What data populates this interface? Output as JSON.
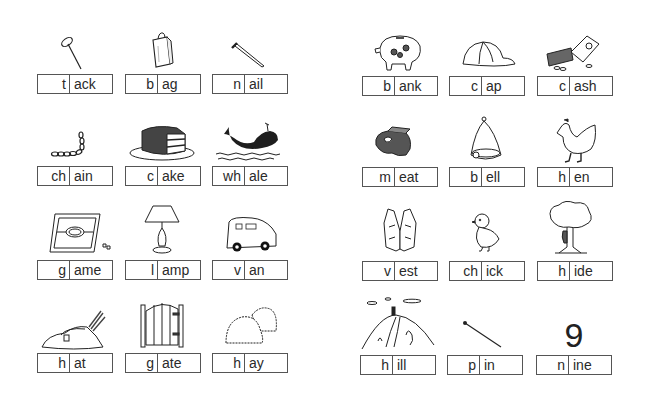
{
  "worksheet": {
    "left_page": {
      "rows": [
        [
          {
            "onset": "t",
            "rime": "ack",
            "picture": "tack-icon"
          },
          {
            "onset": "b",
            "rime": "ag",
            "picture": "bag-icon"
          },
          {
            "onset": "n",
            "rime": "ail",
            "picture": "nail-icon"
          }
        ],
        [
          {
            "onset": "ch",
            "rime": "ain",
            "picture": "chain-icon"
          },
          {
            "onset": "c",
            "rime": "ake",
            "picture": "cake-icon"
          },
          {
            "onset": "wh",
            "rime": "ale",
            "picture": "whale-icon"
          }
        ],
        [
          {
            "onset": "g",
            "rime": "ame",
            "picture": "board-game-icon"
          },
          {
            "onset": "l",
            "rime": "amp",
            "picture": "lamp-icon"
          },
          {
            "onset": "v",
            "rime": "an",
            "picture": "van-icon"
          }
        ],
        [
          {
            "onset": "h",
            "rime": "at",
            "picture": "hat-icon"
          },
          {
            "onset": "g",
            "rime": "ate",
            "picture": "gate-icon"
          },
          {
            "onset": "h",
            "rime": "ay",
            "picture": "hay-icon"
          }
        ]
      ]
    },
    "right_page": {
      "rows": [
        [
          {
            "onset": "b",
            "rime": "ank",
            "picture": "piggy-bank-icon"
          },
          {
            "onset": "c",
            "rime": "ap",
            "picture": "cap-icon"
          },
          {
            "onset": "c",
            "rime": "ash",
            "picture": "cash-icon"
          }
        ],
        [
          {
            "onset": "m",
            "rime": "eat",
            "picture": "meat-icon"
          },
          {
            "onset": "b",
            "rime": "ell",
            "picture": "bell-icon"
          },
          {
            "onset": "h",
            "rime": "en",
            "picture": "hen-icon"
          }
        ],
        [
          {
            "onset": "v",
            "rime": "est",
            "picture": "vest-icon"
          },
          {
            "onset": "ch",
            "rime": "ick",
            "picture": "chick-icon"
          },
          {
            "onset": "h",
            "rime": "ide",
            "picture": "tree-hide-icon"
          }
        ],
        [
          {
            "onset": "h",
            "rime": "ill",
            "picture": "hill-icon"
          },
          {
            "onset": "p",
            "rime": "in",
            "picture": "pin-icon"
          },
          {
            "onset": "n",
            "rime": "ine",
            "picture": "number-nine-icon",
            "picture_text": "9"
          }
        ]
      ]
    }
  }
}
